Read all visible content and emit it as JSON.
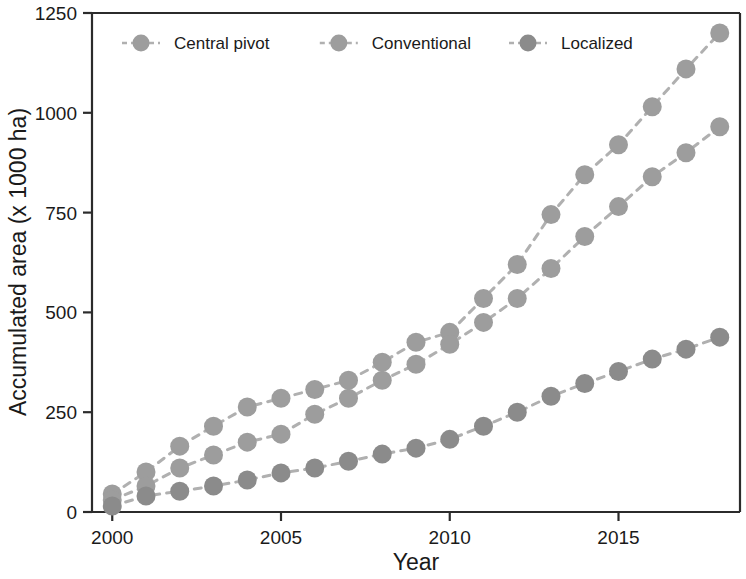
{
  "chart_data": {
    "type": "line",
    "title": "",
    "subtitle": "",
    "xlabel": "Year",
    "ylabel": "Accumulated area (x 1000 ha)",
    "xlim": [
      1999.4,
      2018.6
    ],
    "ylim": [
      0,
      1250
    ],
    "xticks": [
      2000,
      2005,
      2010,
      2015
    ],
    "xtick_labels": [
      "2000",
      "2005",
      "2010",
      "2015"
    ],
    "yticks": [
      0,
      250,
      500,
      750,
      1000,
      1250
    ],
    "ytick_labels": [
      "0",
      "250",
      "500",
      "750",
      "1000",
      "1250"
    ],
    "grid": false,
    "legend_position": "top-left-inside",
    "marker": "filled-circle",
    "linestyle": "dashed",
    "x": [
      2000,
      2001,
      2002,
      2003,
      2004,
      2005,
      2006,
      2007,
      2008,
      2009,
      2010,
      2011,
      2012,
      2013,
      2014,
      2015,
      2016,
      2017,
      2018
    ],
    "series": [
      {
        "name": "Central pivot",
        "color": "#9d9d9d",
        "values": [
          45,
          100,
          165,
          215,
          263,
          285,
          307,
          330,
          375,
          425,
          450,
          535,
          620,
          745,
          845,
          920,
          1015,
          1110,
          1200
        ]
      },
      {
        "name": "Conventional",
        "color": "#9d9d9d",
        "values": [
          30,
          65,
          110,
          143,
          175,
          195,
          245,
          285,
          330,
          370,
          420,
          475,
          535,
          610,
          690,
          765,
          840,
          900,
          965
        ]
      },
      {
        "name": "Localized",
        "color": "#8b8b8b",
        "values": [
          15,
          40,
          52,
          65,
          80,
          98,
          110,
          127,
          145,
          160,
          182,
          215,
          250,
          290,
          322,
          352,
          383,
          408,
          438
        ]
      }
    ]
  },
  "legend": {
    "entries": [
      {
        "label": "Central pivot"
      },
      {
        "label": "Conventional"
      },
      {
        "label": "Localized"
      }
    ]
  },
  "axes": {
    "x_title": "Year",
    "y_title": "Accumulated area (x 1000 ha)"
  },
  "colors": {
    "marker": "#9d9d9d",
    "marker_dark": "#8b8b8b",
    "line": "#b0b0b0",
    "axis": "#2b2b2b",
    "text": "#1a1a1a",
    "background": "#ffffff"
  }
}
